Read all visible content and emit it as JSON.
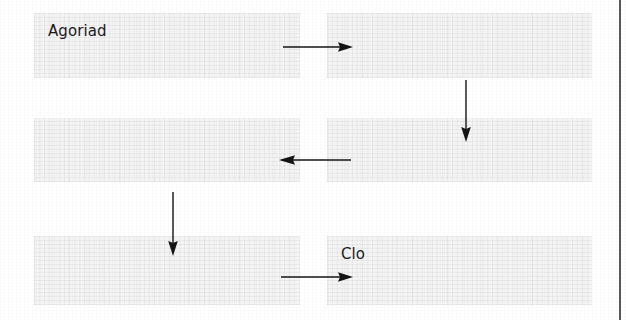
{
  "page": {
    "width": 626,
    "height": 320,
    "background_color": "#ffffff",
    "node_fill_color": "#ececed",
    "ink_color": "#1b1b1b",
    "rule_color": "#59595a"
  },
  "diagram": {
    "type": "flow",
    "title": "",
    "nodes": [
      {
        "id": "node-1",
        "label": "Agoriad",
        "x": 34,
        "y": 13,
        "width": 266,
        "height": 65,
        "row": 1,
        "col": 1
      },
      {
        "id": "node-2",
        "label": "",
        "x": 327,
        "y": 13,
        "width": 265,
        "height": 65,
        "row": 1,
        "col": 2
      },
      {
        "id": "node-3",
        "label": "",
        "x": 34,
        "y": 118,
        "width": 266,
        "height": 64,
        "row": 2,
        "col": 1
      },
      {
        "id": "node-4",
        "label": "",
        "x": 327,
        "y": 118,
        "width": 265,
        "height": 64,
        "row": 2,
        "col": 2
      },
      {
        "id": "node-5",
        "label": "",
        "x": 34,
        "y": 236,
        "width": 266,
        "height": 69,
        "row": 3,
        "col": 1
      },
      {
        "id": "node-6",
        "label": "Clo",
        "x": 327,
        "y": 236,
        "width": 265,
        "height": 69,
        "row": 3,
        "col": 2
      }
    ],
    "connectors": [
      {
        "id": "arrow-1",
        "from": "node-1",
        "to": "node-2",
        "direction": "right",
        "x": 283,
        "y": 41,
        "length": 62
      },
      {
        "id": "arrow-2",
        "from": "node-2",
        "to": "node-4",
        "direction": "down",
        "x": 460,
        "y": 80,
        "length": 57
      },
      {
        "id": "arrow-3",
        "from": "node-4",
        "to": "node-3",
        "direction": "left",
        "x": 279,
        "y": 154,
        "length": 66
      },
      {
        "id": "arrow-4",
        "from": "node-3",
        "to": "node-5",
        "direction": "down",
        "x": 167,
        "y": 192,
        "length": 60
      },
      {
        "id": "arrow-5",
        "from": "node-5",
        "to": "node-6",
        "direction": "right",
        "x": 281,
        "y": 271,
        "length": 66
      }
    ],
    "border_rule": {
      "name": "page-right-rule",
      "x": 619,
      "width": 2
    }
  }
}
